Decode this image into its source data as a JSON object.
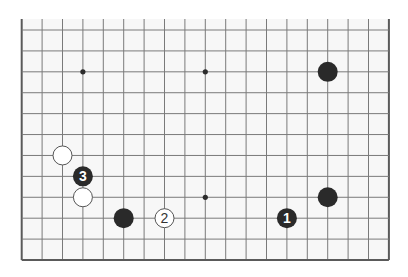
{
  "diagram": {
    "type": "go-board-partial",
    "board": {
      "columns": 19,
      "rows_visible": 12,
      "open_edge": "top",
      "closed_edges": [
        "left",
        "right",
        "bottom"
      ],
      "origin_x": 21.7,
      "origin_y": 30,
      "col_spacing": 20.4,
      "row_spacing": 20.91,
      "top_extent_y": 19,
      "background": "#f7f7f7",
      "grid_color": "#7a7a7a",
      "edge_color": "#5a5a5a"
    },
    "star_points": [
      {
        "col": 3,
        "row": 2
      },
      {
        "col": 9,
        "row": 2
      },
      {
        "col": 9,
        "row": 8
      }
    ],
    "stones": [
      {
        "color": "black",
        "col": 15,
        "row": 2,
        "label": ""
      },
      {
        "color": "white",
        "col": 2,
        "row": 6,
        "label": ""
      },
      {
        "color": "black",
        "col": 3,
        "row": 7,
        "label": "3"
      },
      {
        "color": "white",
        "col": 3,
        "row": 8,
        "label": ""
      },
      {
        "color": "black",
        "col": 5,
        "row": 9,
        "label": ""
      },
      {
        "color": "white",
        "col": 7,
        "row": 9,
        "label": "2"
      },
      {
        "color": "black",
        "col": 13,
        "row": 9,
        "label": "1"
      },
      {
        "color": "black",
        "col": 15,
        "row": 8,
        "label": ""
      }
    ],
    "stone_radius": 10,
    "colors": {
      "black_stone": "#2a2a2a",
      "white_stone": "#ffffff",
      "white_outline": "#555555"
    }
  }
}
